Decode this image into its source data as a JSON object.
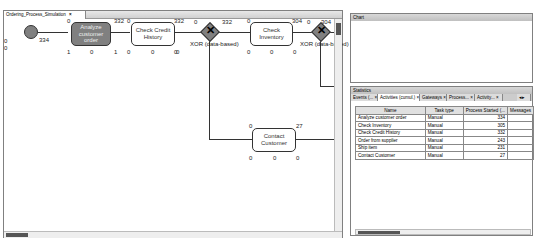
{
  "editor": {
    "tab_label": "Ordering_Process_Simulation",
    "tab_close": "×"
  },
  "diagram": {
    "start": {
      "left_top": "0",
      "left_bottom": "0",
      "right": "334"
    },
    "tasks": [
      {
        "label": "Analyze customer order",
        "top_left": "0",
        "top_right": "332",
        "bottom_left": "1",
        "bottom_mid": "0",
        "bottom_right": "1",
        "selected": true
      },
      {
        "label": "Check Credit History",
        "top_left": "0",
        "top_right": "332",
        "bottom_left": "0",
        "bottom_mid": "0",
        "bottom_right": "0"
      },
      {
        "label": "Check Inventory",
        "top_left": "0",
        "top_right": "304",
        "bottom_left": "0",
        "bottom_mid": "0",
        "bottom_right": "0"
      },
      {
        "label": "Contact Customer",
        "top_left": "0",
        "top_right": "27",
        "bottom_left": "0",
        "bottom_mid": "0",
        "bottom_right": "0"
      }
    ],
    "gateways": [
      {
        "label": "XOR (data-based)",
        "top_left": "0",
        "top_right": "332",
        "bottom_left": "0"
      },
      {
        "label": "XOR (data-based)",
        "top_left": "0",
        "top_right": "304",
        "bottom_left": "0"
      }
    ]
  },
  "chart_panel": {
    "title": "Chart"
  },
  "statistics": {
    "title": "Statistics",
    "tabs": [
      {
        "label": "Events (..."
      },
      {
        "label": "Activities (cumul.)",
        "active": true
      },
      {
        "label": "Gateways"
      },
      {
        "label": "Process..."
      },
      {
        "label": "Activity..."
      }
    ],
    "columns": [
      "Name",
      "Task type",
      "Process Started (...",
      "Messages"
    ],
    "rows": [
      [
        "Analyze customer order",
        "Manual",
        "334",
        ""
      ],
      [
        "Check Inventory",
        "Manual",
        "305",
        ""
      ],
      [
        "Check Credit History",
        "Manual",
        "332",
        ""
      ],
      [
        "Order from supplier",
        "Manual",
        "243",
        ""
      ],
      [
        "Ship item",
        "Manual",
        "231",
        ""
      ],
      [
        "Contact Customer",
        "Manual",
        "27",
        ""
      ]
    ]
  }
}
